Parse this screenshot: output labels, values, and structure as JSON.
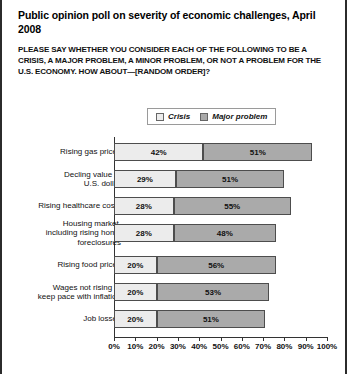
{
  "chart_data": {
    "type": "bar",
    "subtype": "stacked-horizontal",
    "title": "Public opinion poll on severity of economic challenges, April 2008",
    "subtitle": "PLEASE SAY WHETHER YOU CONSIDER EACH OF THE FOLLOWING TO BE A CRISIS, A MAJOR PROBLEM, A MINOR PROBLEM, OR NOT A PROBLEM FOR THE U.S. ECONOMY. HOW ABOUT—[RANDOM ORDER]?",
    "xlabel": "",
    "ylabel": "",
    "xlim": [
      0,
      100
    ],
    "grid": false,
    "legend_position": "top-center",
    "categories": [
      "Rising gas prices",
      "Decling value of\nU.S. dollar",
      "Rising healthcare costs",
      "Housing market,\nincluding rising home\nforeclosures",
      "Rising food prices",
      "Wages not rising to\nkeep pace with inflation",
      "Job losses"
    ],
    "series": [
      {
        "name": "Crisis",
        "color": "#ececec",
        "values": [
          42,
          29,
          28,
          28,
          20,
          20,
          20
        ],
        "labels": [
          "42%",
          "29%",
          "28%",
          "28%",
          "20%",
          "20%",
          "20%"
        ]
      },
      {
        "name": "Major problem",
        "color": "#aaaaaa",
        "values": [
          51,
          51,
          55,
          48,
          56,
          53,
          51
        ],
        "labels": [
          "51%",
          "51%",
          "55%",
          "48%",
          "56%",
          "53%",
          "51%"
        ]
      }
    ],
    "xticks": [
      0,
      10,
      20,
      30,
      40,
      50,
      60,
      70,
      80,
      90,
      100
    ],
    "xtick_labels": [
      "0%",
      "10%",
      "20%",
      "30%",
      "40%",
      "50%",
      "60%",
      "70%",
      "80%",
      "90%",
      "100%"
    ]
  },
  "legend": {
    "items": [
      {
        "label": "Crisis",
        "swatch": "legend-swatch-crisis"
      },
      {
        "label": "Major problem",
        "swatch": "legend-swatch-major-problem"
      }
    ]
  },
  "colors": {
    "crisis": "#ececec",
    "major_problem": "#aaaaaa",
    "border": "#4d4d4d",
    "axis": "#333333",
    "frame": "#2b2b2b"
  }
}
